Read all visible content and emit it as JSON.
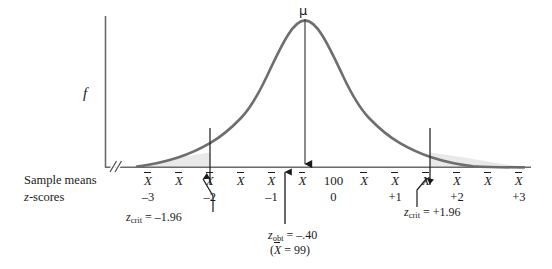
{
  "figure": {
    "type": "normal-distribution-hypothesis-test",
    "y_axis_label": "f",
    "mu_label": "μ",
    "center_value": "100",
    "row_labels": {
      "sample_means": "Sample means",
      "z_scores_prefix": "z",
      "z_scores_suffix": "-scores"
    },
    "sample_mean_symbol": "X",
    "tick_count": 13,
    "z_score_labels": [
      "–3",
      "–2",
      "–1",
      "0",
      "+1",
      "+2",
      "+3"
    ],
    "annotations": {
      "crit_left": {
        "var": "z",
        "sub": "crit",
        "eq": " = –1.96"
      },
      "crit_right": {
        "var": "z",
        "sub": "crit",
        "eq": " = +1.96"
      },
      "obt": {
        "var": "z",
        "sub": "obt",
        "eq": " = –.40"
      },
      "obt_mean_open": "(",
      "obt_mean_var": "X",
      "obt_mean_eq": " = 99)"
    },
    "colors": {
      "curve": "#6e6e6e",
      "axis": "#6b6b6b",
      "shade": "#e8e8e8",
      "text": "#1a1a1a",
      "arrow": "#1a1a1a"
    }
  },
  "chart_data": {
    "type": "line",
    "title": "",
    "xlabel": "z-scores",
    "ylabel": "f",
    "x": [
      -3,
      -2.5,
      -2,
      -1.5,
      -1,
      -0.5,
      0,
      0.5,
      1,
      1.5,
      2,
      2.5,
      3
    ],
    "values": [
      0.0044,
      0.0175,
      0.054,
      0.1295,
      0.242,
      0.3521,
      0.3989,
      0.3521,
      0.242,
      0.1295,
      0.054,
      0.0175,
      0.0044
    ],
    "tick_labels": [
      "–3",
      "",
      "–2",
      "",
      "–1",
      "",
      "0",
      "",
      "+1",
      "",
      "+2",
      "",
      "+3"
    ],
    "xlim": [
      -3.45,
      3.45
    ],
    "ylim": [
      0,
      0.43
    ],
    "grid": false,
    "legend": false,
    "markers": [
      {
        "name": "z_crit_lower",
        "x": -1.96,
        "label": "z_crit = –1.96",
        "style": "vertical-line"
      },
      {
        "name": "z_crit_upper",
        "x": 1.96,
        "label": "z_crit = +1.96",
        "style": "vertical-line"
      },
      {
        "name": "mu",
        "x": 0,
        "label": "μ",
        "style": "down-arrow"
      },
      {
        "name": "z_obt",
        "x": -0.4,
        "label": "z_obt = –.40 (X = 99)",
        "style": "up-arrow"
      }
    ],
    "shaded_regions": [
      {
        "name": "lower-rejection-region",
        "from": -3.45,
        "to": -1.96
      },
      {
        "name": "upper-rejection-region",
        "from": 1.96,
        "to": 3.45
      }
    ]
  }
}
